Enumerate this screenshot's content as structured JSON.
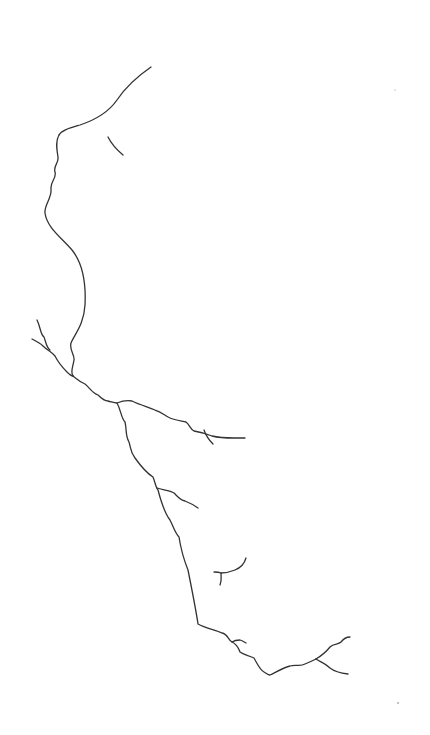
{
  "canvas": {
    "width": 430,
    "height": 735,
    "background": "#ffffff",
    "stroke_color": "#333333"
  },
  "drawing": {
    "description": "Single-line drawing: face profile flowing into a river/crack network with branches",
    "strokes": [
      {
        "name": "profile-forehead",
        "d": "M151,67 C135,78 125,88 117,100 C108,113 95,120 80,125 C70,128 62,130 59,135"
      },
      {
        "name": "eyebrow",
        "d": "M108,137 C112,145 117,150 123,155"
      },
      {
        "name": "profile-face",
        "d": "M59,135 C55,142 57,150 58,157 C59,163 53,166 55,172 C57,178 50,182 51,189 C52,198 44,205 45,213 C47,228 62,238 72,250 C84,265 86,285 85,305 C84,325 74,335 71,343 C69,350 75,355 74,360 C73,367 70,372 73,376"
      },
      {
        "name": "main-channel",
        "d": "M73,376 C78,380 80,382 85,384 C90,388 92,393 98,395 C101,398 104,401 108,401 C112,402 114,403 117,403 C121,410 121,418 125,422 C127,430 125,435 129,442 C131,448 130,452 135,458 C140,465 145,472 153,477 C155,482 156,488 158,490 C162,505 166,515 170,520 C174,528 175,533 179,537 C181,550 184,560 188,570 C192,590 196,610 198,624 C205,628 215,630 222,633 C228,634 228,640 232,642 C238,645 238,648 240,652 C244,655 248,655 254,658 C258,665 260,670 264,672 C266,673 268,675 270,675 C278,671 285,667 290,666 C296,664 300,667 305,664 C310,662 312,661 316,659"
      },
      {
        "name": "left-tributary-upper",
        "d": "M37,320 C41,328 40,334 44,337 C46,342 46,347 50,350"
      },
      {
        "name": "left-tributary-lower",
        "d": "M32,339 C36,341 40,343 43,346 C47,350 52,352 55,356 C58,362 62,367 67,372 C70,375 72,376 73,376"
      },
      {
        "name": "upper-right-tributary",
        "d": "M117,403 C122,401 126,400 132,401 C140,405 148,407 155,410 C162,412 165,416 170,418 C175,420 182,421 186,422 C190,425 190,429 194,431 C200,432 207,434 212,436 C220,438 227,438 234,438 C240,438 242,438 245,438"
      },
      {
        "name": "upper-right-subbranch",
        "d": "M204,430 C206,436 209,440 213,444"
      },
      {
        "name": "mid-tributary",
        "d": "M157,488 C162,490 170,490 174,493 C178,497 180,500 185,501 C190,503 194,505 198,508"
      },
      {
        "name": "isolated-fork",
        "d": "M246,558 C244,565 240,568 235,570 C230,572 226,573 221,573 C219,572 216,572 214,572"
      },
      {
        "name": "isolated-fork-stem",
        "d": "M221,573 C221,578 222,580 220,585"
      },
      {
        "name": "inner-loop-branch",
        "d": "M232,642 C235,640 238,640 240,640 C243,641 244,642 246,643"
      },
      {
        "name": "right-fork-upper",
        "d": "M316,659 C321,656 326,652 330,647 C334,643 338,645 341,642 C344,638 346,637 350,637"
      },
      {
        "name": "right-fork-lower",
        "d": "M316,659 C320,662 325,663 330,668 C335,672 340,673 348,674"
      }
    ],
    "specks": [
      {
        "cx": 398,
        "cy": 703,
        "r": 0.8
      },
      {
        "cx": 395,
        "cy": 90,
        "r": 0.5
      }
    ]
  }
}
